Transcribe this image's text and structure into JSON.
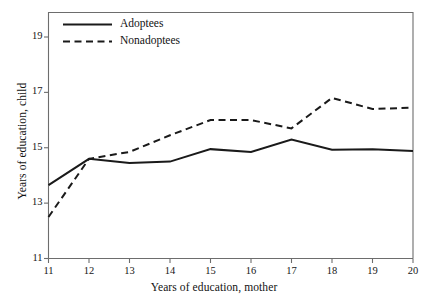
{
  "chart_data": {
    "type": "line",
    "title": "",
    "subtitle": "",
    "xlabel": "Years of education, mother",
    "ylabel": "Years of education, child",
    "x": [
      11,
      12,
      13,
      14,
      15,
      16,
      17,
      18,
      19,
      20
    ],
    "xlim": [
      11,
      20
    ],
    "ylim": [
      11,
      19.9
    ],
    "xticks": [
      "11",
      "12",
      "13",
      "14",
      "15",
      "16",
      "17",
      "18",
      "19",
      "20"
    ],
    "yticks": [
      "11",
      "13",
      "15",
      "17",
      "19"
    ],
    "ytick_values": [
      11,
      13,
      15,
      17,
      19
    ],
    "grid": false,
    "legend_position": "top-left",
    "series": [
      {
        "name": "Adoptees",
        "style": "solid",
        "color": "#1a1a1a",
        "values": [
          13.65,
          14.6,
          14.45,
          14.5,
          14.95,
          14.85,
          15.3,
          14.93,
          14.95,
          14.88
        ]
      },
      {
        "name": "Nonadoptees",
        "style": "dashed",
        "color": "#1a1a1a",
        "values": [
          12.5,
          14.6,
          14.85,
          15.45,
          16.0,
          16.0,
          15.7,
          16.8,
          16.4,
          16.45
        ]
      }
    ]
  },
  "axes": {
    "frame_color": "#6d6d6d",
    "background": "#ffffff"
  },
  "legend": {
    "items": [
      {
        "label": "Adoptees",
        "style": "solid"
      },
      {
        "label": "Nonadoptees",
        "style": "dashed"
      }
    ]
  }
}
